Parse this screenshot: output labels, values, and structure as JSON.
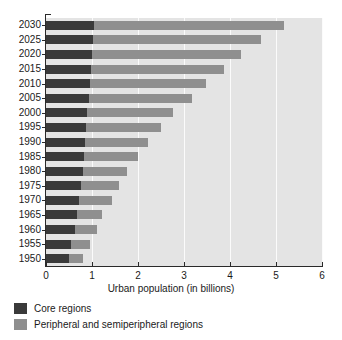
{
  "chart_data": {
    "type": "bar",
    "orientation": "horizontal",
    "stacked": true,
    "title": "",
    "xlabel": "Urban population (in billions)",
    "ylabel": "",
    "xlim": [
      0,
      6
    ],
    "xticks": [
      "0",
      "1",
      "2",
      "3",
      "4",
      "5",
      "6"
    ],
    "grid": "vertical-white-gridlines",
    "legend_position": "below-axis-left",
    "categories": [
      "2030",
      "2025",
      "2020",
      "2015",
      "2010",
      "2005",
      "2000",
      "1995",
      "1990",
      "1985",
      "1980",
      "1975",
      "1970",
      "1965",
      "1960",
      "1955",
      "1950"
    ],
    "series": [
      {
        "name": "Core regions",
        "color": "#3a3a3a",
        "values": [
          1.05,
          1.02,
          1.0,
          0.98,
          0.96,
          0.93,
          0.9,
          0.88,
          0.85,
          0.83,
          0.8,
          0.76,
          0.72,
          0.67,
          0.63,
          0.54,
          0.5
        ]
      },
      {
        "name": "Peripheral and semiperipheral regions",
        "color": "#8f8f8f",
        "values": [
          4.12,
          3.65,
          3.24,
          2.89,
          2.52,
          2.24,
          1.87,
          1.62,
          1.37,
          1.17,
          0.97,
          0.83,
          0.71,
          0.55,
          0.47,
          0.42,
          0.31
        ]
      }
    ],
    "totals": [
      5.17,
      4.67,
      4.24,
      3.87,
      3.48,
      3.17,
      2.77,
      2.5,
      2.22,
      2.0,
      1.77,
      1.59,
      1.43,
      1.22,
      1.1,
      0.96,
      0.81
    ]
  },
  "legend": {
    "items": [
      {
        "label": "Core regions",
        "color": "#3a3a3a"
      },
      {
        "label": "Peripheral and semiperipheral regions",
        "color": "#8f8f8f"
      }
    ]
  },
  "colors": {
    "core": "#3a3a3a",
    "peripheral": "#8f8f8f",
    "plot_background": "#e4e4e4",
    "gridline": "#fbfbfb",
    "axis": "#2a2a2a",
    "page_background": "#ffffff"
  }
}
